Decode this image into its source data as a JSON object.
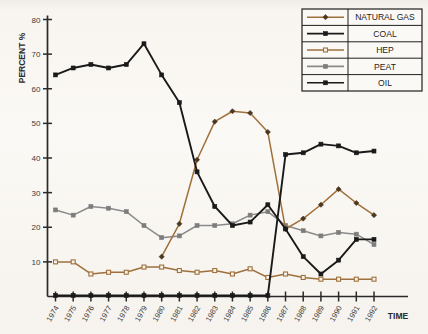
{
  "chart_data": {
    "type": "line",
    "title": "",
    "xlabel": "TIME",
    "ylabel": "PERCENT %",
    "grid": false,
    "legend_position": "top-right",
    "xlim": [
      1974,
      1992
    ],
    "ylim": [
      0,
      80
    ],
    "ytick_labels": [
      "80",
      "70",
      "60",
      "50",
      "40",
      "30",
      "20",
      "10"
    ],
    "yticks": [
      80,
      70,
      60,
      50,
      40,
      30,
      20,
      10
    ],
    "categories": [
      "1974",
      "1975",
      "1976",
      "1977",
      "1978",
      "1979",
      "1980",
      "1981",
      "1982",
      "1983",
      "1984",
      "1985",
      "1986",
      "1987",
      "1988",
      "1989",
      "1990",
      "1991",
      "1992"
    ],
    "series": [
      {
        "name": "NATURAL GAS",
        "color": "#a0703c",
        "marker": "diamond",
        "marker_fill": "#4a3720",
        "x": [
          "1980",
          "1981",
          "1982",
          "1983",
          "1984",
          "1985",
          "1986",
          "1987",
          "1988",
          "1989",
          "1990",
          "1991",
          "1992"
        ],
        "values": [
          11.5,
          21.0,
          39.5,
          50.5,
          53.5,
          53.0,
          47.5,
          19.5,
          22.5,
          26.5,
          31.0,
          27.0,
          23.5
        ]
      },
      {
        "name": "COAL",
        "color": "#1a1a1a",
        "marker": "square",
        "marker_fill": "#1a1a1a",
        "x": [
          "1974",
          "1975",
          "1976",
          "1977",
          "1978",
          "1979",
          "1980",
          "1981",
          "1982",
          "1983",
          "1984",
          "1985",
          "1986",
          "1987",
          "1988",
          "1989",
          "1990",
          "1991",
          "1992"
        ],
        "values": [
          0.3,
          0.3,
          0.3,
          0.3,
          0.3,
          0.3,
          0.3,
          0.3,
          0.3,
          0.3,
          0.3,
          0.3,
          0.3,
          41.0,
          41.5,
          44.0,
          43.5,
          41.5,
          42.0
        ]
      },
      {
        "name": "HEP",
        "color": "#a0703c",
        "marker": "open-square",
        "marker_fill": "#a0703c",
        "x": [
          "1974",
          "1975",
          "1976",
          "1977",
          "1978",
          "1979",
          "1980",
          "1981",
          "1982",
          "1983",
          "1984",
          "1985",
          "1986",
          "1987",
          "1988",
          "1989",
          "1990",
          "1991",
          "1992"
        ],
        "values": [
          10.0,
          10.0,
          6.5,
          7.0,
          7.0,
          8.5,
          8.5,
          7.5,
          7.0,
          7.5,
          6.5,
          8.0,
          5.5,
          6.5,
          5.5,
          5.0,
          5.0,
          5.0,
          5.0
        ]
      },
      {
        "name": "PEAT",
        "color": "#8a8a8a",
        "marker": "square",
        "marker_fill": "#7d7d7d",
        "x": [
          "1974",
          "1975",
          "1976",
          "1977",
          "1978",
          "1979",
          "1980",
          "1981",
          "1982",
          "1983",
          "1984",
          "1985",
          "1986",
          "1987",
          "1988",
          "1989",
          "1990",
          "1991",
          "1992"
        ],
        "values": [
          25.0,
          23.5,
          26.0,
          25.5,
          24.5,
          20.5,
          17.0,
          17.5,
          20.5,
          20.5,
          21.0,
          23.5,
          24.5,
          20.5,
          19.0,
          17.5,
          18.5,
          18.0,
          15.0
        ]
      },
      {
        "name": "OIL",
        "color": "#1a1a1a",
        "marker": "square",
        "marker_fill": "#1a1a1a",
        "x": [
          "1974",
          "1975",
          "1976",
          "1977",
          "1978",
          "1979",
          "1980",
          "1981",
          "1982",
          "1983",
          "1984",
          "1985",
          "1986",
          "1987",
          "1988",
          "1989",
          "1990",
          "1991",
          "1992"
        ],
        "values": [
          64.0,
          66.0,
          67.0,
          66.0,
          67.0,
          73.0,
          64.0,
          56.0,
          36.0,
          26.0,
          20.5,
          21.5,
          26.5,
          19.5,
          11.5,
          6.5,
          10.5,
          16.5,
          16.5
        ]
      }
    ]
  },
  "legend": {
    "items": [
      {
        "label": "NATURAL GAS"
      },
      {
        "label": "COAL"
      },
      {
        "label": "HEP"
      },
      {
        "label": "PEAT"
      },
      {
        "label": "OIL"
      }
    ]
  },
  "axes": {
    "y_title": "PERCENT %",
    "x_title": "TIME"
  }
}
